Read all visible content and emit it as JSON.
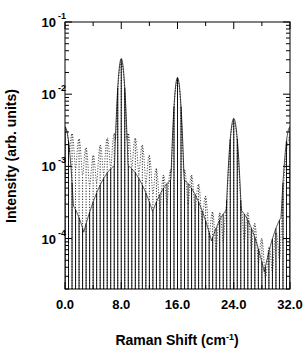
{
  "chart_data": {
    "type": "line",
    "title": "",
    "subtitle": "",
    "xlabel": "Raman Shift (cm",
    "xlabel_exponent": "-1",
    "xlabel_suffix": ")",
    "ylabel": "Intensity (arb. units)",
    "xlim": [
      0.0,
      32.0
    ],
    "ylim": [
      2e-05,
      0.1
    ],
    "yscale": "log",
    "xscale": "linear",
    "grid": false,
    "legend": null,
    "xticks": [
      {
        "value": 0.0,
        "label": "0.0"
      },
      {
        "value": 8.0,
        "label": "8.0"
      },
      {
        "value": 16.0,
        "label": "16.0"
      },
      {
        "value": 24.0,
        "label": "24.0"
      },
      {
        "value": 32.0,
        "label": "32.0"
      }
    ],
    "xminor_ticks": [
      4.0,
      12.0,
      20.0,
      28.0
    ],
    "yticks": [
      {
        "value": 0.1,
        "mantissa": "10",
        "exponent": "-1"
      },
      {
        "value": 0.01,
        "mantissa": "10",
        "exponent": "-2"
      },
      {
        "value": 0.001,
        "mantissa": "10",
        "exponent": "-3"
      },
      {
        "value": 0.0001,
        "mantissa": "10",
        "exponent": "-4"
      }
    ],
    "series": [
      {
        "name": "solid-spectrum",
        "style": "solid",
        "color": "#000000",
        "linewidth": 0.9,
        "comment": "Comb of sharp equally-spaced lines; envelope peaks at 8, 16, 24 cm^-1 and at the 0 and 32 edges.",
        "line_spacing": 0.5,
        "line_width_cm": 0.055,
        "baseline": 2.2e-05,
        "envelope_peaks": [
          {
            "center": 0.0,
            "amplitude": 0.0035,
            "width": 0.75
          },
          {
            "center": 8.0,
            "amplitude": 0.031,
            "width": 0.52
          },
          {
            "center": 16.0,
            "amplitude": 0.017,
            "width": 0.52
          },
          {
            "center": 24.0,
            "amplitude": 0.0046,
            "width": 0.62
          },
          {
            "center": 32.0,
            "amplitude": 0.0035,
            "width": 0.75
          }
        ],
        "envelope_background": [
          {
            "center": 0.0,
            "amplitude": 0.00035,
            "width": 2.6
          },
          {
            "center": 8.0,
            "amplitude": 0.0011,
            "width": 3.6
          },
          {
            "center": 16.0,
            "amplitude": 0.0007,
            "width": 3.4
          },
          {
            "center": 24.0,
            "amplitude": 0.00028,
            "width": 3.0
          },
          {
            "center": 32.0,
            "amplitude": 0.00025,
            "width": 2.6
          }
        ],
        "peak_values": [
          {
            "x": 0.0,
            "y": 0.0035
          },
          {
            "x": 8.0,
            "y": 0.031
          },
          {
            "x": 16.0,
            "y": 0.017
          },
          {
            "x": 24.0,
            "y": 0.0046
          },
          {
            "x": 32.0,
            "y": 0.0035
          }
        ]
      },
      {
        "name": "dotted-spectrum",
        "style": "dotted",
        "color": "#000000",
        "linewidth": 0.9,
        "comment": "Same comb but with much higher sidelobe pedestal; oscillating ripples decay toward high Raman shift.",
        "line_spacing": 0.5,
        "baseline": 3e-05,
        "envelope_peaks": [
          {
            "center": 0.0,
            "amplitude": 0.0035,
            "width": 0.72
          },
          {
            "center": 8.0,
            "amplitude": 0.028,
            "width": 0.5
          },
          {
            "center": 16.0,
            "amplitude": 0.016,
            "width": 0.5
          },
          {
            "center": 24.0,
            "amplitude": 0.0042,
            "width": 0.6
          },
          {
            "center": 32.0,
            "amplitude": 0.0026,
            "width": 0.72
          }
        ],
        "ripple_pedestal": [
          {
            "center": 0.0,
            "amplitude": 0.003,
            "width": 4.2
          },
          {
            "center": 8.0,
            "amplitude": 0.003,
            "width": 4.6
          },
          {
            "center": 16.0,
            "amplitude": 0.00095,
            "width": 4.2
          },
          {
            "center": 24.0,
            "amplitude": 0.0003,
            "width": 3.8
          },
          {
            "center": 32.0,
            "amplitude": 0.00018,
            "width": 3.2
          }
        ],
        "ripple_period": 1.0,
        "ripple_depth": 0.38
      }
    ],
    "annotations": []
  },
  "axes": {
    "frame_color": "#000000",
    "frame_linewidth": 1.0,
    "tick_direction": "in",
    "ylabel_rotation": -90
  }
}
